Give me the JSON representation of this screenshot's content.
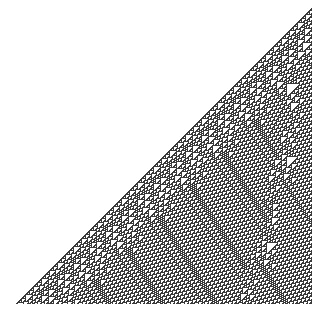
{
  "figure": {
    "title": "Cellular automaton evolution",
    "rule": 110,
    "initial_condition": "single black cell at right edge",
    "steps": 298,
    "cell_colors": {
      "on": "#3a3a3a",
      "off": "#ffffff"
    },
    "background": "#ffffff"
  }
}
